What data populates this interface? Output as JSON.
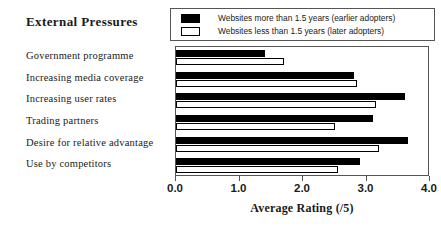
{
  "chart_data": {
    "type": "bar",
    "title": "External Pressures",
    "xlabel": "Average Rating (/5)",
    "ylabel": "",
    "orientation": "horizontal",
    "xlim": [
      0.0,
      4.0
    ],
    "xticks": [
      "0.0",
      "1.0",
      "2.0",
      "3.0",
      "4.0"
    ],
    "xtick_values": [
      0.0,
      1.0,
      2.0,
      3.0,
      4.0
    ],
    "grid": false,
    "legend_position": "top-right",
    "categories": [
      "Government programme",
      "Increasing media coverage",
      "Increasing user rates",
      "Trading partners",
      "Desire for relative advantage",
      "Use by competitors"
    ],
    "series": [
      {
        "name": "Websites more than 1.5 years (earlier adopters)",
        "style": "filled",
        "color": "#000000",
        "values": [
          1.4,
          2.8,
          3.6,
          3.1,
          3.65,
          2.9
        ]
      },
      {
        "name": "Websites less than 1.5 years (later adopters)",
        "style": "hollow",
        "color": "#ffffff",
        "values": [
          1.7,
          2.85,
          3.15,
          2.5,
          3.2,
          2.55
        ]
      }
    ]
  },
  "legend": {
    "items": [
      {
        "label": "Websites more than 1.5 years (earlier adopters)",
        "swatch": "filled"
      },
      {
        "label": "Websites less than 1.5 years (later adopters)",
        "swatch": "hollow"
      }
    ]
  }
}
